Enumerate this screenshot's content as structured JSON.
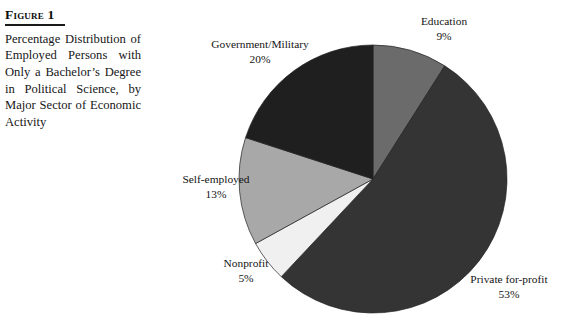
{
  "figure": {
    "label": "Figure 1",
    "caption": "Percentage Distribution of Employed Persons with Only a Bachelor’s Degree in Political Science, by Major Sector of Economic Activity"
  },
  "chart_data": {
    "type": "pie",
    "title": "Percentage Distribution of Employed Persons with Only a Bachelor’s Degree in Political Science, by Major Sector of Economic Activity",
    "units": "percent",
    "total": 100,
    "start_angle_deg": 0,
    "direction": "clockwise",
    "legend": "none",
    "labels_placement": "outside-callout",
    "categories": [
      "Education",
      "Private for-profit",
      "Nonprofit",
      "Self-employed",
      "Government/Military"
    ],
    "values": [
      9,
      53,
      5,
      13,
      20
    ],
    "slices": [
      {
        "name": "Education",
        "value": 9,
        "value_text": "9%",
        "color": "#6b6b6b",
        "start_deg": 0,
        "end_deg": 32.4
      },
      {
        "name": "Private for-profit",
        "value": 53,
        "value_text": "53%",
        "color": "#343434",
        "start_deg": 32.4,
        "end_deg": 223.2
      },
      {
        "name": "Nonprofit",
        "value": 5,
        "value_text": "5%",
        "color": "#f0f0f0",
        "start_deg": 223.2,
        "end_deg": 241.2
      },
      {
        "name": "Self-employed",
        "value": 13,
        "value_text": "13%",
        "color": "#a8a8a8",
        "start_deg": 241.2,
        "end_deg": 288.0
      },
      {
        "name": "Government/Military",
        "value": 20,
        "value_text": "20%",
        "color": "#1f1f1f",
        "start_deg": 288.0,
        "end_deg": 360.0
      }
    ]
  },
  "labels": {
    "education": {
      "name": "Education",
      "pct": "9%"
    },
    "government": {
      "name": "Government/Military",
      "pct": "20%"
    },
    "selfemp": {
      "name": "Self-employed",
      "pct": "13%"
    },
    "nonprofit": {
      "name": "Nonprofit",
      "pct": "5%"
    },
    "forprofit": {
      "name": "Private for-profit",
      "pct": "53%"
    }
  },
  "geometry": {
    "center_x": 223,
    "center_y": 179,
    "radius": 134
  }
}
